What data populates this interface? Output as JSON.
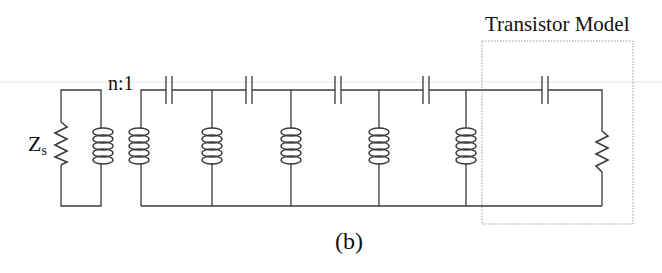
{
  "figure": {
    "caption": "(b)",
    "block_label": "Transistor Model",
    "transformer_ratio": "n:1",
    "source_impedance": {
      "symbol": "Z",
      "subscript": "s"
    }
  },
  "circuit": {
    "components": [
      {
        "type": "resistor",
        "label": "Zs",
        "role": "source impedance"
      },
      {
        "type": "transformer",
        "label": "n:1"
      },
      {
        "type": "capacitor",
        "position": "series",
        "index": 1
      },
      {
        "type": "inductor",
        "position": "shunt",
        "index": 1
      },
      {
        "type": "capacitor",
        "position": "series",
        "index": 2
      },
      {
        "type": "inductor",
        "position": "shunt",
        "index": 2
      },
      {
        "type": "capacitor",
        "position": "series",
        "index": 3
      },
      {
        "type": "inductor",
        "position": "shunt",
        "index": 3
      },
      {
        "type": "capacitor",
        "position": "series",
        "index": 4
      },
      {
        "type": "inductor",
        "position": "shunt",
        "index": 4
      },
      {
        "type": "capacitor",
        "position": "series",
        "index": 5,
        "group": "Transistor Model"
      },
      {
        "type": "resistor",
        "position": "shunt",
        "group": "Transistor Model"
      }
    ]
  },
  "colors": {
    "wire": "#3a3a3a",
    "box": "#9a9a9a",
    "text": "#111111"
  }
}
